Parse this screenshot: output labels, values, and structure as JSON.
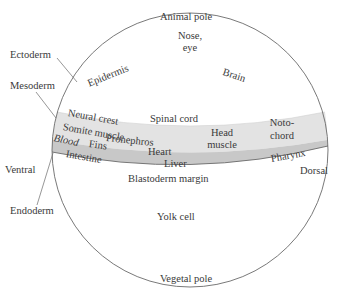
{
  "diagram": {
    "poles": {
      "top": "Animal pole",
      "bottom": "Vegetal pole",
      "left": "Ventral",
      "right": "Dorsal"
    },
    "germ_layers": {
      "ectoderm": "Ectoderm",
      "mesoderm": "Mesoderm",
      "endoderm": "Endoderm"
    },
    "ectoderm_fates": {
      "nose_eye_1": "Nose,",
      "nose_eye_2": "eye",
      "epidermis": "Epidermis",
      "brain": "Brain",
      "spinal_cord": "Spinal cord"
    },
    "mesoderm_fates": {
      "neural_crest": "Neural crest",
      "somite_muscle": "Somite muscle",
      "blood": "Blood",
      "fins": "Fins",
      "pronephros": "Pronephros",
      "heart": "Heart",
      "head_muscle_1": "Head",
      "head_muscle_2": "muscle",
      "notochord_1": "Noto-",
      "notochord_2": "chord"
    },
    "endoderm_fates": {
      "intestine": "Intestine",
      "liver": "Liver",
      "pharynx": "Pharynx"
    },
    "other": {
      "blastoderm_margin": "Blastoderm margin",
      "yolk_cell": "Yolk cell"
    },
    "colors": {
      "outline": "#6a6a6a",
      "mesoderm_band": "#e2e2e2",
      "endoderm_band": "#c9c9c9",
      "text": "#3a3a3a"
    }
  }
}
